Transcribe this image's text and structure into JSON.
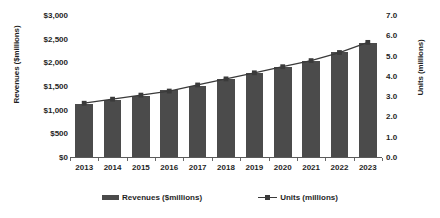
{
  "chart_data": {
    "type": "bar",
    "title": "",
    "subtitle": "",
    "xlabel": "",
    "ylabel": "Revenues ($millions)",
    "y2label": "Units (millions)",
    "grid": false,
    "legend_position": "bottom",
    "categories": [
      "2013",
      "2014",
      "2015",
      "2016",
      "2017",
      "2018",
      "2019",
      "2020",
      "2021",
      "2022",
      "2023"
    ],
    "ylim": [
      0,
      3000
    ],
    "y_ticks": [
      "$0",
      "$500",
      "$1,000",
      "$1,500",
      "$2,000",
      "$2,500",
      "$3,000"
    ],
    "y_tick_values": [
      0,
      500,
      1000,
      1500,
      2000,
      2500,
      3000
    ],
    "y2lim": [
      0.0,
      7.0
    ],
    "y2_ticks": [
      "0.0",
      "1.0",
      "2.0",
      "3.0",
      "4.0",
      "5.0",
      "6.0",
      "7.0"
    ],
    "y2_tick_values": [
      0,
      1,
      2,
      3,
      4,
      5,
      6,
      7
    ],
    "series": [
      {
        "name": "Revenues ($millions)",
        "type": "bar",
        "axis": "left",
        "color": "#4b4b4b",
        "values": [
          1150,
          1230,
          1320,
          1430,
          1520,
          1660,
          1790,
          1920,
          2060,
          2240,
          2430
        ]
      },
      {
        "name": "Units (millions)",
        "type": "line",
        "axis": "right",
        "color": "#3a3a3a",
        "marker": "square",
        "values": [
          2.7,
          2.9,
          3.1,
          3.3,
          3.6,
          3.9,
          4.2,
          4.5,
          4.8,
          5.2,
          5.7
        ]
      }
    ]
  },
  "legend": {
    "items": [
      {
        "label": "Revenues ($millions)",
        "marker": "bar-swatch"
      },
      {
        "label": "Units (millions)",
        "marker": "line-marker-swatch"
      }
    ]
  }
}
